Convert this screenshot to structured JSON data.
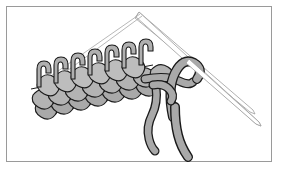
{
  "figure": {
    "caption_text": "",
    "colors": {
      "background": "#ffffff",
      "frame_border": "#9a9a9a",
      "yarn_fill": "#a9a9a9",
      "yarn_fill_light": "#c4c4c4",
      "yarn_outline": "#1a1a1a",
      "needle_fill": "#ffffff",
      "needle_outline": "#9d9d9d",
      "caption_color": "#d2d2d2"
    },
    "elements": {
      "frame_label": "illustration-frame",
      "needle_front_label": "front-knitting-needle",
      "needle_back_label": "back-knitting-needle",
      "needle_tip_label": "needle-tips",
      "fabric_label": "knitted-fabric",
      "upright_loops_label": "stitch-loops-on-needle",
      "yarn_tail_left_label": "yarn-tail-left",
      "yarn_tail_right_label": "yarn-tail-right",
      "working_loop_label": "working-yarn-loop"
    },
    "counts": {
      "upright_stitches": 7,
      "fabric_rows": 3,
      "needles": 2,
      "yarn_tails": 2
    },
    "needles": {
      "tip_point": [
        138,
        9
      ],
      "front_end": [
        254,
        120
      ],
      "back_end": [
        252,
        108
      ]
    }
  }
}
